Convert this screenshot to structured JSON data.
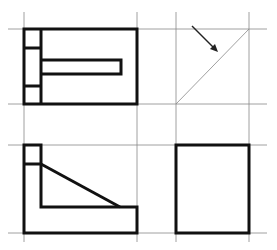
{
  "diagram": {
    "type": "orthographic-projection",
    "colors": {
      "background": "#ffffff",
      "outline": "#111111",
      "guide": "#888888"
    },
    "views": [
      {
        "id": "top-view",
        "position": "top-left"
      },
      {
        "id": "miter-construction",
        "position": "top-right"
      },
      {
        "id": "front-view",
        "position": "bottom-left"
      },
      {
        "id": "side-view",
        "position": "bottom-right"
      }
    ]
  }
}
